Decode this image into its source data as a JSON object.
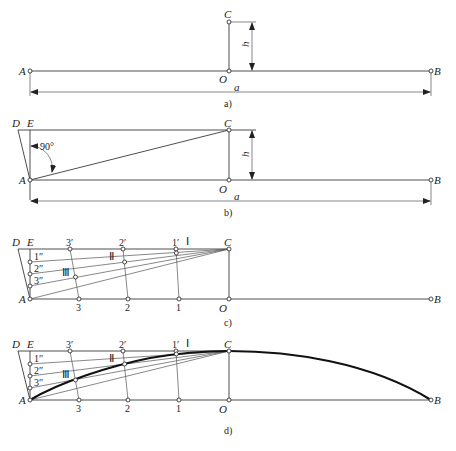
{
  "panels": {
    "a": {
      "caption": "a)",
      "labels": {
        "A": "A",
        "B": "B",
        "C": "C",
        "O": "O",
        "h": "h",
        "a": "a"
      }
    },
    "b": {
      "caption": "b)",
      "labels": {
        "A": "A",
        "B": "B",
        "C": "C",
        "O": "O",
        "D": "D",
        "E": "E",
        "h": "h",
        "a": "a",
        "angle": "90°"
      }
    },
    "c": {
      "caption": "c)",
      "labels": {
        "A": "A",
        "B": "B",
        "C": "C",
        "O": "O",
        "D": "D",
        "E": "E",
        "p3p": "3′",
        "p2p": "2′",
        "p1p": "1′",
        "p1pp": "1″",
        "p2pp": "2″",
        "p3pp": "3″",
        "p3": "3",
        "p2": "2",
        "p1": "1",
        "rI": "Ⅰ",
        "rII": "Ⅱ",
        "rIII": "Ⅲ"
      }
    },
    "d": {
      "caption": "d)",
      "labels": {
        "A": "A",
        "B": "B",
        "C": "C",
        "O": "O",
        "D": "D",
        "E": "E",
        "p3p": "3′",
        "p2p": "2′",
        "p1p": "1′",
        "p1pp": "1″",
        "p2pp": "2″",
        "p3pp": "3″",
        "p3": "3",
        "p2": "2",
        "p1": "1",
        "rI": "Ⅰ",
        "rII": "Ⅱ",
        "rIII": "Ⅲ"
      }
    }
  }
}
